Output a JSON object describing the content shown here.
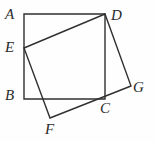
{
  "figure": {
    "type": "geometry-diagram",
    "stroke_color": "#303030",
    "background_color": "#fefefe",
    "stroke_width": 1.4,
    "labels": [
      {
        "id": "A",
        "text": "A",
        "x": 5,
        "y": 7
      },
      {
        "id": "D",
        "text": "D",
        "x": 111,
        "y": 8
      },
      {
        "id": "E",
        "text": "E",
        "x": 5,
        "y": 40
      },
      {
        "id": "B",
        "text": "B",
        "x": 5,
        "y": 88
      },
      {
        "id": "G",
        "text": "G",
        "x": 133,
        "y": 80
      },
      {
        "id": "C",
        "text": "C",
        "x": 100,
        "y": 101
      },
      {
        "id": "F",
        "text": "F",
        "x": 45,
        "y": 122
      }
    ],
    "points": {
      "A": {
        "x": 24,
        "y": 14
      },
      "D": {
        "x": 105,
        "y": 14
      },
      "E": {
        "x": 24,
        "y": 48
      },
      "B": {
        "x": 24,
        "y": 99
      },
      "C": {
        "x": 105,
        "y": 99
      },
      "G": {
        "x": 131,
        "y": 86
      },
      "F": {
        "x": 50,
        "y": 118
      }
    },
    "shapes": [
      {
        "name": "square-abcd",
        "vertices": [
          "A",
          "D",
          "C",
          "B"
        ],
        "closed": true
      },
      {
        "name": "quadrilateral-edgf",
        "vertices": [
          "E",
          "D",
          "G",
          "F"
        ],
        "closed": true
      }
    ]
  }
}
